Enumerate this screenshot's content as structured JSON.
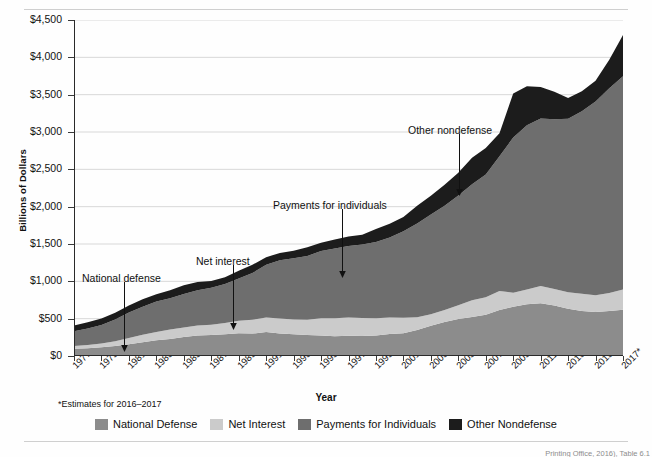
{
  "figure": {
    "y_axis_title": "Billions of Dollars",
    "x_axis_title": "Year",
    "footnote": "*Estimates for 2016–2017",
    "source_note": "Printing Office, 2016), Table 6.1"
  },
  "legend": {
    "items": [
      {
        "label": "National Defense",
        "color": "#8c8c8c"
      },
      {
        "label": "Net Interest",
        "color": "#cbcbcb"
      },
      {
        "label": "Payments for Individuals",
        "color": "#6e6e6e"
      },
      {
        "label": "Other Nondefense",
        "color": "#1c1c1c"
      }
    ]
  },
  "annotations": [
    {
      "name": "national-defense",
      "text": "National defense",
      "x": 82,
      "y": 272,
      "arrow_x": 124,
      "arrow_y0": 282,
      "arrow_y1": 352
    },
    {
      "name": "net-interest",
      "text": "Net interest",
      "x": 196,
      "y": 255,
      "arrow_x": 233,
      "arrow_y0": 265,
      "arrow_y1": 330
    },
    {
      "name": "payments-for-individuals",
      "text": "Payments for individuals",
      "x": 273,
      "y": 199,
      "arrow_x": 342,
      "arrow_y0": 209,
      "arrow_y1": 278
    },
    {
      "name": "other-nondefense",
      "text": "Other nondefense",
      "x": 408,
      "y": 124,
      "arrow_x": 459,
      "arrow_y0": 134,
      "arrow_y1": 196
    }
  ],
  "chart_data": {
    "type": "area",
    "stacked": true,
    "title": "",
    "xlabel": "Year",
    "ylabel": "Billions of Dollars",
    "ylim": [
      0,
      4500
    ],
    "ytick_labels": [
      "$0",
      "$500",
      "$1,000",
      "$1,500",
      "$2,000",
      "$2,500",
      "$3,000",
      "$3,500",
      "$4,000",
      "$4,500"
    ],
    "ytick_values": [
      0,
      500,
      1000,
      1500,
      2000,
      2500,
      3000,
      3500,
      4000,
      4500
    ],
    "grid": "horizontal",
    "legend_position": "bottom",
    "xtick_labels": [
      "1977",
      "1979",
      "1981",
      "1983",
      "1985",
      "1987",
      "1989",
      "1991",
      "1993",
      "1995",
      "1997",
      "1999",
      "2001",
      "2003",
      "2005",
      "2007",
      "2009",
      "2011",
      "2013",
      "2015",
      "2017*"
    ],
    "x": [
      1977,
      1978,
      1979,
      1980,
      1981,
      1982,
      1983,
      1984,
      1985,
      1986,
      1987,
      1988,
      1989,
      1990,
      1991,
      1992,
      1993,
      1994,
      1995,
      1996,
      1997,
      1998,
      1999,
      2000,
      2001,
      2002,
      2003,
      2004,
      2005,
      2006,
      2007,
      2008,
      2009,
      2010,
      2011,
      2012,
      2013,
      2014,
      2015,
      2016,
      2017
    ],
    "series": [
      {
        "name": "National Defense",
        "color": "#8c8c8c",
        "values": [
          97,
          104,
          116,
          134,
          158,
          185,
          210,
          227,
          253,
          273,
          282,
          290,
          304,
          300,
          320,
          303,
          292,
          282,
          273,
          266,
          271,
          269,
          275,
          295,
          306,
          349,
          405,
          456,
          495,
          522,
          551,
          616,
          661,
          694,
          706,
          678,
          634,
          604,
          590,
          604,
          620
        ]
      },
      {
        "name": "Net Interest",
        "color": "#cbcbcb",
        "values": [
          38,
          44,
          52,
          64,
          82,
          100,
          111,
          127,
          129,
          136,
          138,
          151,
          169,
          184,
          194,
          199,
          198,
          202,
          232,
          241,
          244,
          241,
          229,
          222,
          206,
          171,
          153,
          160,
          184,
          226,
          237,
          253,
          187,
          196,
          230,
          220,
          221,
          229,
          223,
          241,
          270
        ]
      },
      {
        "name": "Payments for Individuals",
        "color": "#6e6e6e",
        "values": [
          198,
          221,
          246,
          292,
          341,
          375,
          409,
          418,
          448,
          473,
          493,
          522,
          566,
          627,
          708,
          782,
          820,
          856,
          901,
          934,
          958,
          984,
          1022,
          1070,
          1160,
          1253,
          1336,
          1397,
          1470,
          1553,
          1644,
          1807,
          2078,
          2201,
          2246,
          2273,
          2324,
          2444,
          2596,
          2742,
          2856
        ]
      },
      {
        "name": "Other Nondefense",
        "color": "#1c1c1c",
        "values": [
          76,
          83,
          87,
          88,
          97,
          101,
          98,
          108,
          116,
          108,
          91,
          93,
          104,
          110,
          101,
          97,
          98,
          117,
          112,
          119,
          129,
          131,
          176,
          183,
          191,
          238,
          251,
          279,
          304,
          354,
          354,
          306,
          591,
          521,
          421,
          367,
          276,
          270,
          279,
          380,
          554
        ]
      }
    ]
  }
}
